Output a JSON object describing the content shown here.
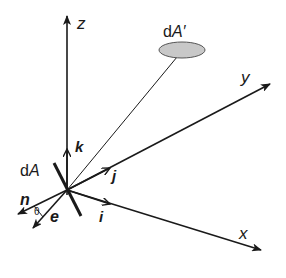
{
  "diagram": {
    "axes": {
      "x": {
        "label": "x"
      },
      "y": {
        "label": "y"
      },
      "z": {
        "label": "z"
      }
    },
    "unit_vectors": {
      "i": {
        "label": "i"
      },
      "j": {
        "label": "j"
      },
      "k": {
        "label": "k"
      }
    },
    "surface_elements": {
      "dA": {
        "prefix": "d",
        "symbol": "A"
      },
      "dA_prime": {
        "prefix": "d",
        "symbol": "A′"
      }
    },
    "direction_vectors": {
      "n": {
        "label": "n"
      },
      "e": {
        "label": "e"
      }
    },
    "angle": {
      "label": "θ"
    },
    "colors": {
      "stroke": "#1a1a1a",
      "ellipse_fill": "#c8c8c8",
      "ellipse_stroke": "#555555"
    }
  }
}
